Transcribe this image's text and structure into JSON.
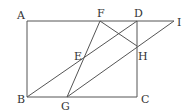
{
  "diagram": {
    "type": "geometry",
    "labels": {
      "A": "A",
      "B": "B",
      "C": "C",
      "D": "D",
      "E": "E",
      "F": "F",
      "G": "G",
      "H": "H",
      "I": "I"
    },
    "points": {
      "A": [
        27,
        21
      ],
      "B": [
        27,
        97
      ],
      "C": [
        137,
        97
      ],
      "D": [
        137,
        21
      ],
      "E": [
        82,
        59
      ],
      "F": [
        100,
        21
      ],
      "G": [
        67,
        97
      ],
      "H": [
        137,
        46
      ],
      "I": [
        174,
        21
      ]
    },
    "segments": [
      [
        "A",
        "D"
      ],
      [
        "D",
        "I"
      ],
      [
        "A",
        "B"
      ],
      [
        "B",
        "C"
      ],
      [
        "C",
        "D"
      ],
      [
        "B",
        "D"
      ],
      [
        "F",
        "G"
      ],
      [
        "F",
        "H"
      ],
      [
        "G",
        "I"
      ]
    ]
  }
}
